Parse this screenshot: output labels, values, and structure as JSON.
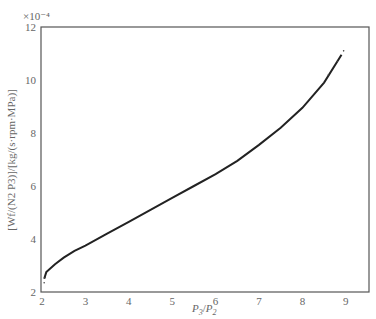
{
  "chart_data": {
    "type": "line",
    "title": "",
    "xlabel": "P3/P2",
    "ylabel": "[Wf/(N2 P3)]/[kg/(s·rpm·MPa)]",
    "y_multiplier": "×10⁻⁴",
    "xlim": [
      2,
      9.5
    ],
    "ylim": [
      2,
      12
    ],
    "x_ticks": [
      2,
      3,
      4,
      5,
      6,
      7,
      8,
      9
    ],
    "y_ticks": [
      2,
      4,
      6,
      8,
      10,
      12
    ],
    "grid": false,
    "legend": null,
    "series": [
      {
        "name": "fuel flow parameter",
        "x": [
          2.05,
          2.1,
          2.3,
          2.5,
          2.75,
          3.0,
          3.5,
          4.0,
          4.5,
          5.0,
          5.5,
          6.0,
          6.5,
          7.0,
          7.5,
          8.0,
          8.5,
          8.9
        ],
        "y": [
          2.5,
          2.75,
          3.05,
          3.3,
          3.55,
          3.75,
          4.2,
          4.65,
          5.1,
          5.55,
          6.0,
          6.45,
          6.95,
          7.55,
          8.2,
          8.95,
          9.9,
          10.95
        ]
      }
    ]
  },
  "axes": {
    "y_exponent": "×10⁻⁴",
    "x_tick_labels": [
      "2",
      "3",
      "4",
      "5",
      "6",
      "7",
      "8",
      "9"
    ],
    "y_tick_labels": [
      "2",
      "4",
      "6",
      "8",
      "10",
      "12"
    ],
    "x_label_main": "P",
    "x_label_sub1": "3",
    "x_label_sep": "/",
    "x_label_main2": "P",
    "x_label_sub2": "2",
    "y_label": "[W_f/(N_2 P_3)]/[kg/(s·rpm·MPa)]"
  }
}
